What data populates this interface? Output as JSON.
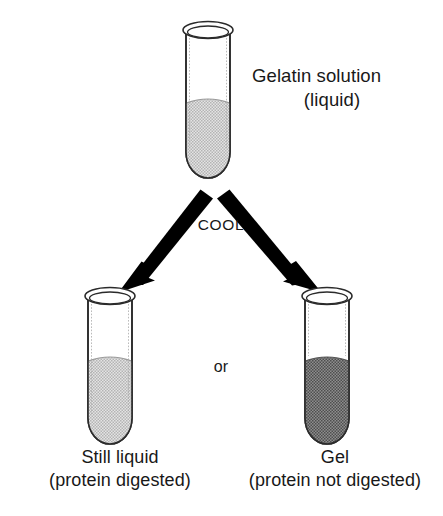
{
  "figure": {
    "title_absent": true,
    "background_color": "#ffffff",
    "ink_color": "#181818"
  },
  "labels": {
    "top_line1": "Gelatin solution",
    "top_line2": "(liquid)",
    "process": "COOL",
    "connector": "or",
    "left_line1": "Still liquid",
    "left_line2": "(protein digested)",
    "right_line1": "Gel",
    "right_line2": "(protein not digested)"
  },
  "tubes": [
    {
      "id": "top-tube",
      "name": "gelatin-solution-tube",
      "fill_label": "light stipple",
      "fill_color": "#c9c9c9",
      "contents": "Gelatin solution (liquid)",
      "x": 186,
      "y": 22,
      "width": 44,
      "height": 158,
      "liquid_level_y": 100
    },
    {
      "id": "left-tube",
      "name": "still-liquid-tube",
      "fill_label": "light stipple",
      "fill_color": "#c9c9c9",
      "contents": "Still liquid (protein digested)",
      "x": 88,
      "y": 288,
      "width": 44,
      "height": 158,
      "liquid_level_y": 358
    },
    {
      "id": "right-tube",
      "name": "gel-tube",
      "fill_label": "dark stipple",
      "fill_color": "#717171",
      "contents": "Gel (protein not digested)",
      "x": 305,
      "y": 288,
      "width": 44,
      "height": 158,
      "liquid_level_y": 358
    }
  ],
  "arrows": [
    {
      "id": "arrow-left",
      "name": "cool-arrow-left",
      "from": [
        196,
        192
      ],
      "to": [
        124,
        281
      ],
      "color": "#000000",
      "label": "COOL"
    },
    {
      "id": "arrow-right",
      "name": "cool-arrow-right",
      "from": [
        231,
        192
      ],
      "to": [
        318,
        281
      ],
      "color": "#000000",
      "label": "COOL"
    }
  ]
}
